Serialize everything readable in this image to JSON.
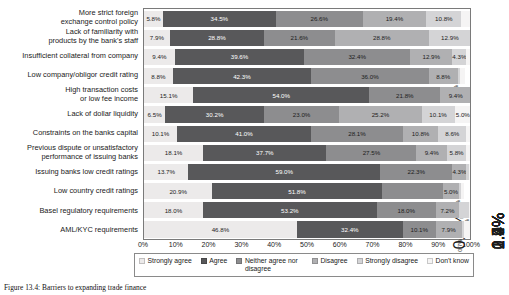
{
  "chart_data": {
    "type": "bar",
    "orientation": "horizontal",
    "stacked": true,
    "normalized_percent": true,
    "title": "",
    "xlabel": "",
    "ylabel": "",
    "xlim": [
      0,
      100
    ],
    "xticks": [
      "0%",
      "10%",
      "20%",
      "30%",
      "40%",
      "50%",
      "60%",
      "70%",
      "80%",
      "90%",
      "100%"
    ],
    "grid": false,
    "legend_position": "bottom",
    "series": [
      {
        "name": "Strongly agree",
        "color": "#eceaea",
        "values": [
          5.8,
          7.9,
          9.4,
          8.8,
          15.1,
          6.5,
          10.1,
          18.1,
          13.7,
          20.9,
          18.0,
          46.8
        ]
      },
      {
        "name": "Agree",
        "color": "#58585a",
        "values": [
          34.5,
          28.8,
          39.6,
          42.3,
          54.0,
          30.2,
          41.0,
          37.7,
          59.0,
          51.8,
          53.2,
          32.4
        ]
      },
      {
        "name": "Neither agree nor disagree",
        "color": "#8d8d8f",
        "values": [
          26.6,
          21.6,
          32.4,
          36.0,
          21.8,
          23.0,
          28.1,
          27.5,
          22.3,
          18.7,
          18.0,
          10.1
        ]
      },
      {
        "name": "Disagree",
        "color": "#b0b0b2",
        "values": [
          19.4,
          28.8,
          12.9,
          8.8,
          9.4,
          25.2,
          10.8,
          9.4,
          4.3,
          5.0,
          7.2,
          7.9
        ]
      },
      {
        "name": "Strongly disagree",
        "color": "#d4d4d6",
        "values": [
          10.8,
          12.9,
          4.3,
          0.7,
          0.0,
          10.1,
          8.6,
          5.8,
          0.7,
          0.7,
          2.9,
          0.7
        ]
      },
      {
        "name": "Don't know",
        "color": "#f5f4f4",
        "values": [
          2.9,
          0.0,
          1.4,
          1.5,
          0.0,
          5.0,
          1.4,
          1.4,
          0.7,
          0.7,
          0.7,
          2.2
        ]
      }
    ],
    "categories": [
      "More strict foreign exchange control policy",
      "Lack of familiarity with products by the bank's staff",
      "Insufficient collateral from company",
      "Low company/obligor credit rating",
      "High transaction costs or low fee income",
      "Lack of dollar liquidity",
      "Constraints on the banks capital",
      "Previous dispute or unsatisfactory performance of issuing banks",
      "Issuing banks low credit ratings",
      "Low country credit ratings",
      "Basel regulatory requirements",
      "AML/KYC requirements"
    ],
    "rows": [
      {
        "category_lines": [
          "More strict foreign",
          "exchange control policy"
        ],
        "segments": [
          {
            "value": 5.8,
            "label": "5.8%",
            "rotated": false,
            "outside": false
          },
          {
            "value": 34.5,
            "label": "34.5%",
            "rotated": false,
            "outside": false
          },
          {
            "value": 26.6,
            "label": "26.6%",
            "rotated": false,
            "outside": false
          },
          {
            "value": 19.4,
            "label": "19.4%",
            "rotated": false,
            "outside": false
          },
          {
            "value": 10.8,
            "label": "10.8%",
            "rotated": false,
            "outside": false
          },
          {
            "value": 2.9,
            "label": "2.9%",
            "rotated": true,
            "outside": true
          }
        ]
      },
      {
        "category_lines": [
          "Lack of familiarity with",
          "products by the bank's staff"
        ],
        "segments": [
          {
            "value": 7.9,
            "label": "7.9%",
            "rotated": false,
            "outside": false
          },
          {
            "value": 28.8,
            "label": "28.8%",
            "rotated": false,
            "outside": false
          },
          {
            "value": 21.6,
            "label": "21.6%",
            "rotated": false,
            "outside": false
          },
          {
            "value": 28.8,
            "label": "28.8%",
            "rotated": false,
            "outside": false
          },
          {
            "value": 12.9,
            "label": "12.9%",
            "rotated": false,
            "outside": false
          },
          {
            "value": 0.0,
            "label": "",
            "rotated": false,
            "outside": false
          }
        ]
      },
      {
        "category_lines": [
          "Insufficient collateral from company"
        ],
        "segments": [
          {
            "value": 9.4,
            "label": "9.4%",
            "rotated": false,
            "outside": false
          },
          {
            "value": 39.6,
            "label": "39.6%",
            "rotated": false,
            "outside": false
          },
          {
            "value": 32.4,
            "label": "32.4%",
            "rotated": false,
            "outside": false
          },
          {
            "value": 12.9,
            "label": "12.9%",
            "rotated": false,
            "outside": false
          },
          {
            "value": 4.3,
            "label": "4.3%",
            "rotated": false,
            "outside": false
          },
          {
            "value": 1.4,
            "label": "1.4%",
            "rotated": true,
            "outside": true
          }
        ]
      },
      {
        "category_lines": [
          "Low company/obligor credit rating"
        ],
        "segments": [
          {
            "value": 8.8,
            "label": "8.8%",
            "rotated": false,
            "outside": false
          },
          {
            "value": 42.3,
            "label": "42.3%",
            "rotated": false,
            "outside": false
          },
          {
            "value": 36.0,
            "label": "36.0%",
            "rotated": false,
            "outside": false
          },
          {
            "value": 8.8,
            "label": "8.8%",
            "rotated": false,
            "outside": false
          },
          {
            "value": 0.7,
            "label": "0.7%",
            "rotated": true,
            "outside": false
          },
          {
            "value": 1.5,
            "label": "1.5%",
            "rotated": true,
            "outside": true
          }
        ]
      },
      {
        "category_lines": [
          "High transaction costs",
          "or low fee income"
        ],
        "segments": [
          {
            "value": 15.1,
            "label": "15.1%",
            "rotated": false,
            "outside": false
          },
          {
            "value": 54.0,
            "label": "54.0%",
            "rotated": false,
            "outside": false
          },
          {
            "value": 21.8,
            "label": "21.8%",
            "rotated": false,
            "outside": false
          },
          {
            "value": 9.4,
            "label": "9.4%",
            "rotated": false,
            "outside": false
          },
          {
            "value": 0.0,
            "label": "",
            "rotated": false,
            "outside": false
          },
          {
            "value": 0.0,
            "label": "",
            "rotated": false,
            "outside": false
          }
        ]
      },
      {
        "category_lines": [
          "Lack of dollar liquidity"
        ],
        "segments": [
          {
            "value": 6.5,
            "label": "6.5%",
            "rotated": false,
            "outside": false
          },
          {
            "value": 30.2,
            "label": "30.2%",
            "rotated": false,
            "outside": false
          },
          {
            "value": 23.0,
            "label": "23.0%",
            "rotated": false,
            "outside": false
          },
          {
            "value": 25.2,
            "label": "25.2%",
            "rotated": false,
            "outside": false
          },
          {
            "value": 10.1,
            "label": "10.1%",
            "rotated": false,
            "outside": false
          },
          {
            "value": 5.0,
            "label": "5.0%",
            "rotated": false,
            "outside": false
          }
        ]
      },
      {
        "category_lines": [
          "Constraints on the banks capital"
        ],
        "segments": [
          {
            "value": 10.1,
            "label": "10.1%",
            "rotated": false,
            "outside": false
          },
          {
            "value": 41.0,
            "label": "41.0%",
            "rotated": false,
            "outside": false
          },
          {
            "value": 28.1,
            "label": "28.1%",
            "rotated": false,
            "outside": false
          },
          {
            "value": 10.8,
            "label": "10.8%",
            "rotated": false,
            "outside": false
          },
          {
            "value": 8.6,
            "label": "8.6%",
            "rotated": false,
            "outside": false
          },
          {
            "value": 1.4,
            "label": "1.4%",
            "rotated": true,
            "outside": true
          }
        ]
      },
      {
        "category_lines": [
          "Previous dispute or unsatisfactory",
          "performance of issuing banks"
        ],
        "segments": [
          {
            "value": 18.1,
            "label": "18.1%",
            "rotated": false,
            "outside": false
          },
          {
            "value": 37.7,
            "label": "37.7%",
            "rotated": false,
            "outside": false
          },
          {
            "value": 27.5,
            "label": "27.5%",
            "rotated": false,
            "outside": false
          },
          {
            "value": 9.4,
            "label": "9.4%",
            "rotated": false,
            "outside": false
          },
          {
            "value": 5.8,
            "label": "5.8%",
            "rotated": false,
            "outside": false
          },
          {
            "value": 1.4,
            "label": "1.4%",
            "rotated": true,
            "outside": true
          }
        ]
      },
      {
        "category_lines": [
          "Issuing banks low credit ratings"
        ],
        "segments": [
          {
            "value": 13.7,
            "label": "13.7%",
            "rotated": false,
            "outside": false
          },
          {
            "value": 59.0,
            "label": "59.0%",
            "rotated": false,
            "outside": false
          },
          {
            "value": 22.3,
            "label": "22.3%",
            "rotated": false,
            "outside": false
          },
          {
            "value": 4.3,
            "label": "4.3%",
            "rotated": false,
            "outside": false
          },
          {
            "value": 0.7,
            "label": "0.7%",
            "rotated": true,
            "outside": true
          },
          {
            "value": 0.7,
            "label": "0.7%",
            "rotated": true,
            "outside": true
          }
        ]
      },
      {
        "category_lines": [
          "Low country credit ratings"
        ],
        "segments": [
          {
            "value": 20.9,
            "label": "20.9%",
            "rotated": false,
            "outside": false
          },
          {
            "value": 51.8,
            "label": "51.8%",
            "rotated": false,
            "outside": false
          },
          {
            "value": 18.7,
            "label": "",
            "rotated": false,
            "outside": false
          },
          {
            "value": 5.0,
            "label": "5.0%",
            "rotated": false,
            "outside": false
          },
          {
            "value": 0.7,
            "label": "0.7%",
            "rotated": true,
            "outside": false
          },
          {
            "value": 0.7,
            "label": "0.7%",
            "rotated": true,
            "outside": true
          }
        ]
      },
      {
        "category_lines": [
          "Basel regulatory requirements"
        ],
        "segments": [
          {
            "value": 18.0,
            "label": "18.0%",
            "rotated": false,
            "outside": false
          },
          {
            "value": 53.2,
            "label": "53.2%",
            "rotated": false,
            "outside": false
          },
          {
            "value": 18.0,
            "label": "18.0%",
            "rotated": false,
            "outside": false
          },
          {
            "value": 7.2,
            "label": "7.2%",
            "rotated": false,
            "outside": false
          },
          {
            "value": 2.9,
            "label": "2.9%",
            "rotated": true,
            "outside": true
          },
          {
            "value": 0.7,
            "label": "0.7%",
            "rotated": true,
            "outside": false
          }
        ]
      },
      {
        "category_lines": [
          "AML/KYC requirements"
        ],
        "segments": [
          {
            "value": 46.8,
            "label": "46.8%",
            "rotated": false,
            "outside": false
          },
          {
            "value": 32.4,
            "label": "32.4%",
            "rotated": false,
            "outside": false
          },
          {
            "value": 10.1,
            "label": "10.1%",
            "rotated": false,
            "outside": false
          },
          {
            "value": 7.9,
            "label": "7.9%",
            "rotated": false,
            "outside": false
          },
          {
            "value": 0.7,
            "label": "0.7%",
            "rotated": true,
            "outside": false
          },
          {
            "value": 2.2,
            "label": "2.2%",
            "rotated": true,
            "outside": true
          }
        ]
      }
    ]
  },
  "legend": {
    "items": [
      {
        "label": "Strongly agree",
        "color": "#eceaea"
      },
      {
        "label": "Agree",
        "color": "#58585a"
      },
      {
        "label": "Neither agree nor disagree",
        "color": "#8d8d8f"
      },
      {
        "label": "Disagree",
        "color": "#b0b0b2"
      },
      {
        "label": "Strongly disagree",
        "color": "#d4d4d6"
      },
      {
        "label": "Don't know",
        "color": "#f5f4f4"
      }
    ]
  },
  "caption": {
    "text": "Figure 13.4: Barriers to expanding trade finance"
  }
}
